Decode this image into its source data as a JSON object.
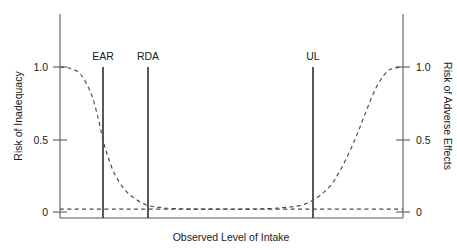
{
  "chart_data": {
    "type": "line",
    "title": "",
    "xlabel": "Observed Level of Intake",
    "ylabel": "Risk of Inadequacy",
    "y2label": "Risk of Adverse Effects",
    "xlim": [
      0,
      1
    ],
    "ylim": [
      0,
      1
    ],
    "grid": false,
    "legend": "none",
    "x_ticks": [],
    "y_ticks": [
      "1.0",
      "0.5",
      "0"
    ],
    "y_tick_values": [
      1.0,
      0.5,
      0
    ],
    "y2_ticks": [
      "1.0",
      "0.5",
      "0"
    ],
    "y2_tick_values": [
      1.0,
      0.5,
      0
    ],
    "annotations": [
      {
        "label": "EAR",
        "x": 0.125,
        "note": "Estimated Average Requirement marker"
      },
      {
        "label": "RDA",
        "x": 0.257,
        "note": "Recommended Dietary Allowance marker"
      },
      {
        "label": "UL",
        "x": 0.738,
        "note": "Tolerable Upper Intake Level marker"
      }
    ],
    "series": [
      {
        "name": "Risk of Inadequacy",
        "axis": "left",
        "style": "dashed",
        "x": [
          0.0,
          0.03,
          0.06,
          0.09,
          0.11,
          0.125,
          0.14,
          0.16,
          0.19,
          0.22,
          0.25,
          0.28,
          0.32,
          0.38,
          0.45,
          0.55,
          0.7,
          0.85,
          1.0
        ],
        "values": [
          1.0,
          0.99,
          0.95,
          0.82,
          0.66,
          0.5,
          0.38,
          0.26,
          0.15,
          0.09,
          0.05,
          0.035,
          0.025,
          0.02,
          0.02,
          0.02,
          0.02,
          0.02,
          0.02
        ]
      },
      {
        "name": "Risk of Adverse Effects",
        "axis": "right",
        "style": "dashed",
        "x": [
          0.0,
          0.2,
          0.4,
          0.55,
          0.65,
          0.72,
          0.78,
          0.82,
          0.86,
          0.89,
          0.92,
          0.95,
          0.97,
          1.0
        ],
        "values": [
          0.02,
          0.02,
          0.02,
          0.02,
          0.03,
          0.06,
          0.16,
          0.3,
          0.5,
          0.68,
          0.85,
          0.96,
          0.99,
          1.0
        ]
      }
    ]
  },
  "axes": {
    "left": {
      "title": "Risk of Inadequacy",
      "ticks": [
        {
          "label": "1.0"
        },
        {
          "label": "0.5"
        },
        {
          "label": "0"
        }
      ]
    },
    "right": {
      "title": "Risk of Adverse Effects",
      "ticks": [
        {
          "label": "1.0"
        },
        {
          "label": "0.5"
        },
        {
          "label": "0"
        }
      ]
    },
    "bottom": {
      "title": "Observed Level of Intake"
    }
  },
  "markers": [
    {
      "label": "EAR"
    },
    {
      "label": "RDA"
    },
    {
      "label": "UL"
    }
  ],
  "colors": {
    "axis": "#5a5a5a",
    "marker": "#3b3b3b",
    "curve": "#4a4a4a",
    "text": "#1a1a1a",
    "background": "#ffffff"
  }
}
